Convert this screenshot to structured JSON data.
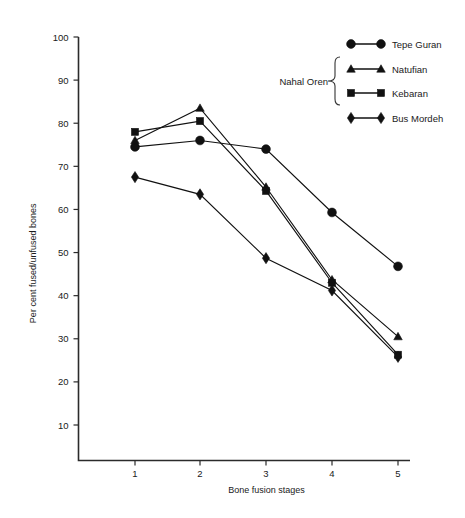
{
  "chart_data": {
    "type": "line",
    "title": "",
    "xlabel": "Bone fusion stages",
    "ylabel": "Per cent fused/unfused bones",
    "x": [
      1,
      2,
      3,
      4,
      5
    ],
    "xtick_labels": [
      "1",
      "2",
      "3",
      "4",
      "5"
    ],
    "ytick_labels": [
      "10",
      "20",
      "30",
      "40",
      "50",
      "60",
      "70",
      "80",
      "90",
      "100"
    ],
    "yticks": [
      10,
      20,
      30,
      40,
      50,
      60,
      70,
      80,
      90,
      100
    ],
    "ylim": [
      0,
      100
    ],
    "xlim": [
      0.6,
      5.4
    ],
    "grid": false,
    "legend_position": "top-right",
    "series": [
      {
        "name": "Tepe Guran",
        "marker": "circle",
        "values": [
          74.5,
          76.0,
          74.0,
          59.3,
          46.8
        ]
      },
      {
        "name": "Natufian",
        "marker": "triangle",
        "values": [
          76.0,
          83.5,
          65.2,
          43.7,
          30.5
        ]
      },
      {
        "name": "Kebaran",
        "marker": "square",
        "values": [
          78.0,
          80.5,
          64.3,
          43.0,
          26.3
        ]
      },
      {
        "name": "Bus Mordeh",
        "marker": "diamond",
        "values": [
          67.5,
          63.5,
          48.7,
          41.2,
          25.8
        ]
      }
    ],
    "annotations": [
      {
        "text": "Nahal Oren",
        "groups": [
          "Natufian",
          "Kebaran"
        ]
      }
    ],
    "colors": {
      "ink": "#111111",
      "axis": "#2b2b2b",
      "background": "#ffffff"
    }
  },
  "legend": {
    "items": [
      {
        "label": "Tepe Guran",
        "marker": "circle"
      },
      {
        "label": "Natufian",
        "marker": "triangle"
      },
      {
        "label": "Kebaran",
        "marker": "square"
      },
      {
        "label": "Bus Mordeh",
        "marker": "diamond"
      }
    ],
    "group_label": "Nahal Oren"
  }
}
